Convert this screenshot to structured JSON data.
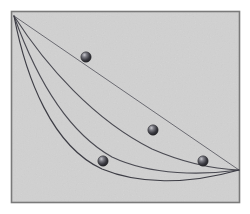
{
  "figure": {
    "canvas": {
      "width": 250,
      "height": 214
    },
    "colors": {
      "page_background": "#ffffff",
      "panel_background": "#e8e8e8",
      "panel_border": "#7a7a7a",
      "curve_stroke": "#4a4a52",
      "chord_stroke": "#6b6b72",
      "ball_dark": "#2e2e33",
      "ball_mid": "#5a5a62",
      "ball_highlight": "#c9c9cf",
      "texture": "#d2d2d2"
    },
    "panel": {
      "x": 11,
      "y": 11,
      "width": 229,
      "height": 192,
      "border_width": 2
    },
    "start_point": {
      "x": 14,
      "y": 16,
      "label": "start"
    },
    "end_point": {
      "x": 239,
      "y": 170,
      "label": "end"
    },
    "paths": [
      {
        "name": "straight-chord",
        "label": "Straight line",
        "stroke": "#6b6b72",
        "stroke_width": 1,
        "d": "M 14 16 L 239 170"
      },
      {
        "name": "shallow-arc",
        "label": "Shallow arc",
        "stroke": "#4a4a52",
        "stroke_width": 1.1,
        "d": "M 14 16 C 46 66 94 120 152 149 C 184 163 216 169 239 170"
      },
      {
        "name": "deep-arc",
        "label": "Deep arc",
        "stroke": "#4a4a52",
        "stroke_width": 1.1,
        "d": "M 14 16 C 34 72 64 130 112 157 C 152 176 204 175 239 170"
      },
      {
        "name": "cycloid-brachistochrone",
        "label": "Cycloid (brachistochrone)",
        "stroke": "#3d3d45",
        "stroke_width": 1.2,
        "d": "M 14 16 C 26 78 52 146 102 169 C 138 184 186 185 239 170"
      }
    ],
    "balls": [
      {
        "name": "ball-on-straight-chord",
        "x": 86,
        "y": 57,
        "r": 5.2,
        "path": "straight-chord"
      },
      {
        "name": "ball-on-shallow-arc",
        "x": 153,
        "y": 130,
        "r": 5.2,
        "path": "shallow-arc"
      },
      {
        "name": "ball-on-deep-arc",
        "x": 103,
        "y": 161,
        "r": 5.2,
        "path": "deep-arc"
      },
      {
        "name": "ball-on-cycloid",
        "x": 203,
        "y": 161,
        "r": 5.2,
        "path": "cycloid-brachistochrone"
      }
    ]
  }
}
